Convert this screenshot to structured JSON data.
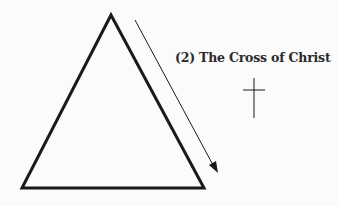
{
  "diagram": {
    "label": "(2) The Cross of Christ",
    "shapes": {
      "triangle": {
        "apex": [
          111,
          15
        ],
        "bottom_left": [
          22,
          188
        ],
        "bottom_right": [
          204,
          188
        ],
        "stroke": "#1a1a1a"
      },
      "arrow": {
        "from": [
          135,
          20
        ],
        "to": [
          217,
          172
        ],
        "direction": "down-right"
      },
      "cross": {
        "x": 254,
        "top": 78,
        "bottom": 118,
        "crossbar_y": 90,
        "crossbar_x": [
          243,
          265
        ]
      }
    },
    "icons": [
      "triangle-icon",
      "arrow-icon",
      "cross-icon"
    ]
  }
}
